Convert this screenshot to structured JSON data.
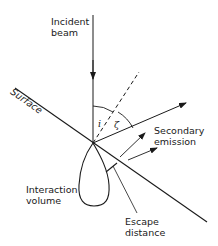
{
  "labels": {
    "incident_beam_1": "Incident",
    "incident_beam_2": "beam",
    "surface": "Surface",
    "secondary_emission_1": "Secondary",
    "secondary_emission_2": "emission",
    "interaction_volume_1": "Interaction",
    "interaction_volume_2": "volume",
    "escape_distance_1": "Escape",
    "escape_distance_2": "distance",
    "angle_incidence": "i",
    "angle_emission": "ζ"
  },
  "colors": {
    "line": "#1a1a1a",
    "background": "#ffffff"
  }
}
